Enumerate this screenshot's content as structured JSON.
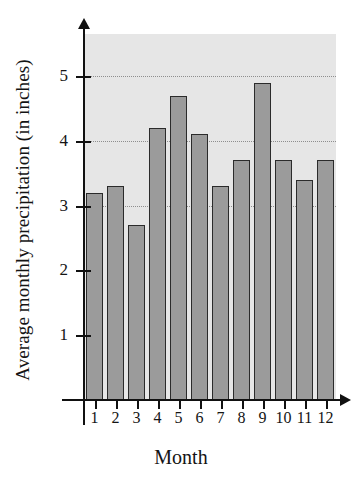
{
  "chart_data": {
    "type": "bar",
    "title": "",
    "xlabel": "Month",
    "ylabel": "Average monthly precipitation (in inches)",
    "categories": [
      "1",
      "2",
      "3",
      "4",
      "5",
      "6",
      "7",
      "8",
      "9",
      "10",
      "11",
      "12"
    ],
    "values": [
      3.2,
      3.3,
      2.7,
      4.2,
      4.7,
      4.1,
      3.3,
      3.7,
      4.9,
      3.7,
      3.4,
      3.7
    ],
    "ylim": [
      0,
      5.65
    ],
    "xlim": [
      0.4,
      12.6
    ],
    "yticks": [
      1,
      2,
      3,
      4,
      5
    ],
    "ytick_labels": [
      "1",
      "2",
      "3",
      "4",
      "5"
    ],
    "gridlines": [
      3,
      4,
      5
    ],
    "grid": true,
    "legend": null,
    "bar_fill_color": "#9b9b9b",
    "bar_edge_color": "#2b2b2b",
    "plot_background_color": "#e6e6e6",
    "axis_color": "#111111",
    "figure_background_color": "#ffffff"
  }
}
